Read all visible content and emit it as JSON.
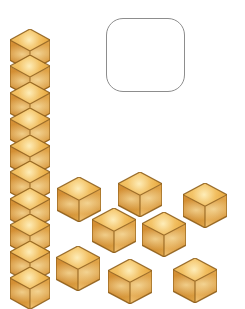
{
  "scene": {
    "title": "Base-ten blocks: one ten-rod and loose unit cubes",
    "background_color": "#ffffff",
    "block_colors": {
      "top_face": "#f0bb5c",
      "left_face": "#c9852e",
      "right_face": "#dca048",
      "seam": "#8a5a18"
    }
  },
  "answer_box": {
    "label": "empty-answer-box",
    "value": "",
    "placeholder": "",
    "x": 106,
    "y": 18,
    "width": 79,
    "height": 74,
    "border_color": "#8d8d8d",
    "corner_radius": 17
  },
  "ten_rod": {
    "label": "ten-rod",
    "unit_count": 10,
    "value": 10,
    "x": 10,
    "y": 29,
    "width": 40,
    "cube_height": 28,
    "total_height": 278
  },
  "unit_cubes": {
    "label": "loose-unit-cubes",
    "count": 8,
    "items": [
      {
        "id": 1,
        "x": 57,
        "y": 177,
        "size": 44
      },
      {
        "id": 2,
        "x": 118,
        "y": 172,
        "size": 44
      },
      {
        "id": 3,
        "x": 183,
        "y": 183,
        "size": 44
      },
      {
        "id": 4,
        "x": 92,
        "y": 208,
        "size": 44
      },
      {
        "id": 5,
        "x": 142,
        "y": 212,
        "size": 44
      },
      {
        "id": 6,
        "x": 56,
        "y": 246,
        "size": 44
      },
      {
        "id": 7,
        "x": 108,
        "y": 259,
        "size": 44
      },
      {
        "id": 8,
        "x": 173,
        "y": 258,
        "size": 44
      }
    ]
  },
  "totals": {
    "tens": 1,
    "ones": 8,
    "total_blocks": 18
  }
}
